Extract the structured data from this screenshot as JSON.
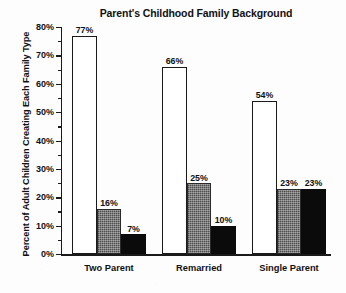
{
  "chart_data": {
    "type": "bar",
    "title": "Parent's Childhood Family Background",
    "xlabel": "",
    "ylabel": "Percent of Adult Children Creating Each Family Type",
    "categories": [
      "Two Parent",
      "Remarried",
      "Single Parent"
    ],
    "ylim": [
      0,
      80
    ],
    "yticks": [
      0,
      10,
      20,
      30,
      40,
      50,
      60,
      70,
      80
    ],
    "ytick_labels": [
      "0%",
      "10%",
      "20%",
      "30%",
      "40%",
      "50%",
      "60%",
      "70%",
      "80%"
    ],
    "minor_tick_interval": 5,
    "grid": false,
    "legend": false,
    "legend_position": "none",
    "series": [
      {
        "name": "white-bar",
        "fill": "#ffffff",
        "values": [
          77,
          66,
          54
        ],
        "value_labels": [
          "77%",
          "66%",
          "54%"
        ]
      },
      {
        "name": "gray-bar",
        "fill": "#6e6e6e",
        "values": [
          16,
          25,
          23
        ],
        "value_labels": [
          "16%",
          "25%",
          "23%"
        ]
      },
      {
        "name": "black-bar",
        "fill": "#0b0b0b",
        "values": [
          7,
          10,
          23
        ],
        "value_labels": [
          "7%",
          "10%",
          "23%"
        ]
      }
    ]
  },
  "colors": {
    "axis": "#1a1a1a",
    "text": "#111111",
    "background": "#fdfdfd",
    "bar_white": "#ffffff",
    "bar_gray": "#6e6e6e",
    "bar_black": "#0b0b0b"
  }
}
